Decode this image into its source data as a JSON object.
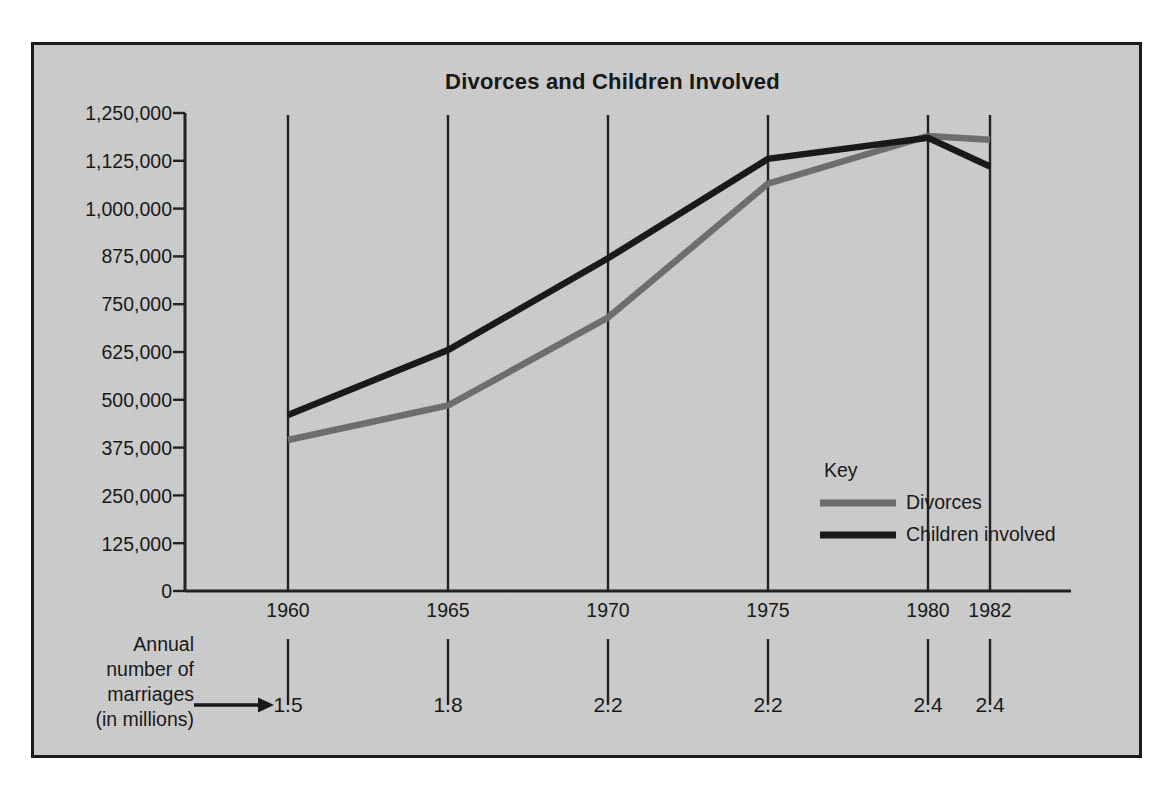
{
  "chart_data": {
    "type": "line",
    "title": "Divorces and Children Involved",
    "xlabel": "",
    "ylabel": "",
    "grid": "vertical-only",
    "legend_position": "inside-right",
    "legend_title": "Key",
    "x": [
      1960,
      1965,
      1970,
      1975,
      1980,
      1982
    ],
    "categories": [
      "1960",
      "1965",
      "1970",
      "1975",
      "1980",
      "1982"
    ],
    "ylim": [
      0,
      1250000
    ],
    "yticks": [
      0,
      125000,
      250000,
      375000,
      500000,
      625000,
      750000,
      875000,
      1000000,
      1125000,
      1250000
    ],
    "ytick_labels": [
      "0",
      "125,000",
      "250,000",
      "375,000",
      "500,000",
      "625,000",
      "750,000",
      "875,000",
      "1,000,000",
      "1,125,000",
      "1,250,000"
    ],
    "series": [
      {
        "name": "Divorces",
        "color": "#6b6b6b",
        "values": [
          395000,
          485000,
          715000,
          1065000,
          1190000,
          1180000
        ]
      },
      {
        "name": "Children involved",
        "color": "#121212",
        "values": [
          460000,
          630000,
          870000,
          1130000,
          1185000,
          1110000
        ]
      }
    ],
    "annotation": {
      "label_lines": [
        "Annual",
        "number of",
        "marriages",
        "(in millions)"
      ],
      "arrow": "→",
      "values": [
        "1.5",
        "1.8",
        "2.2",
        "2.2",
        "2.4",
        "2.4"
      ]
    }
  },
  "legend": {
    "title": "Key",
    "entries": [
      {
        "label": "Divorces",
        "color": "#6b6b6b"
      },
      {
        "label": "Children involved",
        "color": "#121212"
      }
    ]
  },
  "axes": {
    "y_tick_labels": [
      "1,250,000",
      "1,125,000",
      "1,000,000",
      "875,000",
      "750,000",
      "625,000",
      "500,000",
      "375,000",
      "250,000",
      "125,000",
      "0"
    ],
    "x_tick_labels": [
      "1960",
      "1965",
      "1970",
      "1975",
      "1980",
      "1982"
    ]
  },
  "marriages": {
    "caption_lines": [
      "Annual",
      "number of",
      "marriages",
      "(in millions)"
    ],
    "values": [
      "1.5",
      "1.8",
      "2.2",
      "2.2",
      "2.4",
      "2.4"
    ]
  },
  "colors": {
    "background": "#cdcdcd",
    "frame": "#1b1b1b",
    "divorces": "#6b6b6b",
    "children": "#121212",
    "text": "#111111"
  }
}
